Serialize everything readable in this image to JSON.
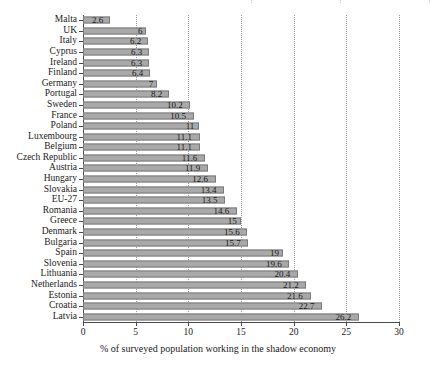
{
  "chart_data": {
    "type": "bar",
    "orientation": "horizontal",
    "title": "",
    "subtitle": "",
    "xlabel": "% of surveyed population working in the shadow economy",
    "ylabel": "",
    "xlim": [
      0,
      30
    ],
    "xticks": [
      0,
      5,
      10,
      15,
      20,
      25,
      30
    ],
    "xtick_labels": [
      "0",
      "5",
      "10",
      "15",
      "20",
      "25",
      "30"
    ],
    "grid": "vertical dotted gridlines at each x tick",
    "legend": "none",
    "bar_color": "#a9a9a9",
    "bar_edge_color": "#7a7a7a",
    "axis_color": "#4a4a4a",
    "gridline_color": "#9a9a9a",
    "data_labels": "value shown at end of each bar",
    "sort_order": "ascending from top to bottom",
    "categories": [
      "Malta",
      "UK",
      "Italy",
      "Cyprus",
      "Ireland",
      "Finland",
      "Germany",
      "Portugal",
      "Sweden",
      "France",
      "Poland",
      "Luxembourg",
      "Belgium",
      "Czech Republic",
      "Austria",
      "Hungary",
      "Slovakia",
      "EU-27",
      "Romania",
      "Greece",
      "Denmark",
      "Bulgaria",
      "Spain",
      "Slovenia",
      "Lithuania",
      "Netherlands",
      "Estonia",
      "Croatia",
      "Latvia"
    ],
    "values": [
      2.6,
      6,
      6.2,
      6.3,
      6.3,
      6.4,
      7,
      8.2,
      10.2,
      10.5,
      11,
      11.1,
      11.1,
      11.6,
      11.9,
      12.6,
      13.4,
      13.5,
      14.6,
      15,
      15.6,
      15.7,
      19,
      19.6,
      20.4,
      21.2,
      21.6,
      22.7,
      26.2
    ],
    "value_labels": [
      "2.6",
      "6",
      "6.2",
      "6.3",
      "6.3",
      "6.4",
      "7",
      "8.2",
      "10.2",
      "10.5",
      "11",
      "11.1",
      "11.1",
      "11.6",
      "11.9",
      "12.6",
      "13.4",
      "13.5",
      "14.6",
      "15",
      "15.6",
      "15.7",
      "19",
      "19.6",
      "20.4",
      "21.2",
      "21.6",
      "22.7",
      "26.2"
    ]
  }
}
